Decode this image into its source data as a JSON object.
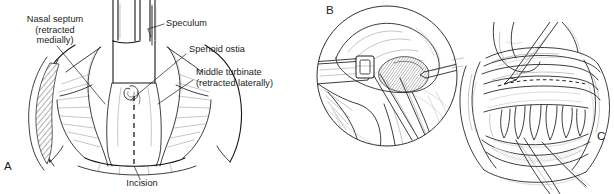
{
  "figure": {
    "kind": "surgical-illustration",
    "background_color": "#ffffff",
    "ink_color": "#1b1b1b"
  },
  "panels": [
    {
      "id": "A",
      "letter": "A",
      "name": "nasal-speculum-view",
      "description": "Anterior view through nasal speculum showing septum, sphenoid ostia, middle turbinate and planned incision"
    },
    {
      "id": "B",
      "letter": "B",
      "name": "endoscopic-circular-view",
      "description": "Circular close-up endoscopic view of instrument at the sphenoid region"
    },
    {
      "id": "C",
      "letter": "C",
      "name": "intraoral-sublabial-view",
      "description": "Intraoral view of upper teeth and gingiva with sublabial incision and retractors"
    }
  ],
  "labels": [
    {
      "name": "label-nasal-septum",
      "lines": [
        "Nasal septum",
        "(retracted",
        "medially)"
      ],
      "text": "Nasal septum\n(retracted\nmedially)",
      "align": "center",
      "panel": "A"
    },
    {
      "name": "label-speculum",
      "lines": [
        "Speculum"
      ],
      "text": "Speculum",
      "align": "left",
      "panel": "A"
    },
    {
      "name": "label-sphenoid-ostia",
      "lines": [
        "Spenoid ostia"
      ],
      "text": "Spenoid ostia",
      "align": "left",
      "panel": "A"
    },
    {
      "name": "label-middle-turbinate",
      "lines": [
        "Middle turbinate",
        "(retracted laterally)"
      ],
      "text": "Middle turbinate\n(retracted laterally)",
      "align": "left",
      "panel": "A"
    },
    {
      "name": "label-incision",
      "lines": [
        "Incision"
      ],
      "text": "Incision",
      "align": "center",
      "panel": "A"
    }
  ]
}
